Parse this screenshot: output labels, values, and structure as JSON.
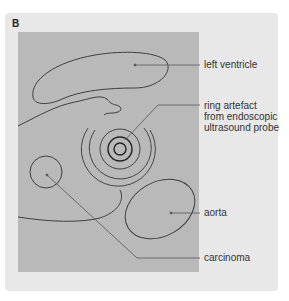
{
  "figure": {
    "panel_letter": "B",
    "colors": {
      "panel_bg": "#e8e8e8",
      "image_bg": "#b9b9b9",
      "outline": "#3f3f3f",
      "leader": "#555555",
      "text": "#333333"
    },
    "labels": {
      "left_ventricle": "left ventricle",
      "ring_artefact_line1": "ring artefact",
      "ring_artefact_line2": "from endoscopic",
      "ring_artefact_line3": "ultrasound probe",
      "aorta": "aorta",
      "carcinoma": "carcinoma"
    }
  }
}
